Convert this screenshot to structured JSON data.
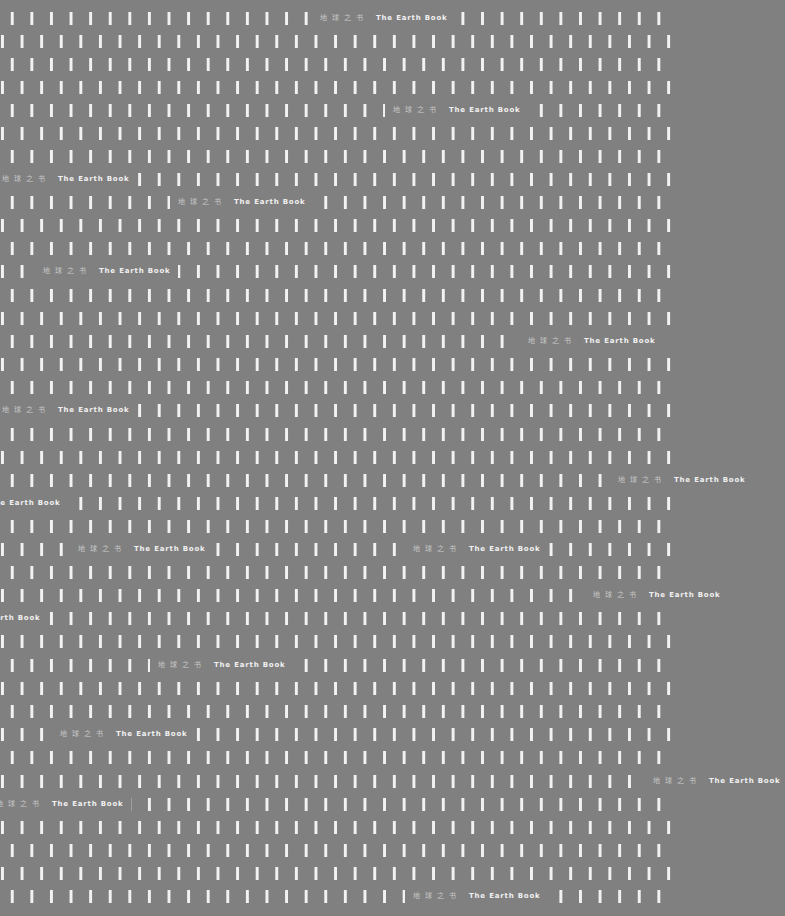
{
  "cover": {
    "background_color": "#808080",
    "bar_color": "#f2f2f2",
    "label_zh": "地球之书",
    "label_en": "The Earth Book"
  }
}
